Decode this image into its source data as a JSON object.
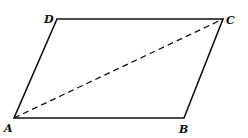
{
  "diagram": {
    "type": "parallelogram",
    "vertices": {
      "A": {
        "label": "A",
        "x": 14,
        "y": 118
      },
      "B": {
        "label": "B",
        "x": 184,
        "y": 118
      },
      "C": {
        "label": "C",
        "x": 223,
        "y": 19
      },
      "D": {
        "label": "D",
        "x": 57,
        "y": 19
      }
    },
    "edges": [
      [
        "A",
        "B"
      ],
      [
        "B",
        "C"
      ],
      [
        "C",
        "D"
      ],
      [
        "D",
        "A"
      ]
    ],
    "dashed_diagonal": [
      "A",
      "C"
    ],
    "colors": {
      "stroke": "#111111",
      "background": "#ffffff"
    }
  }
}
